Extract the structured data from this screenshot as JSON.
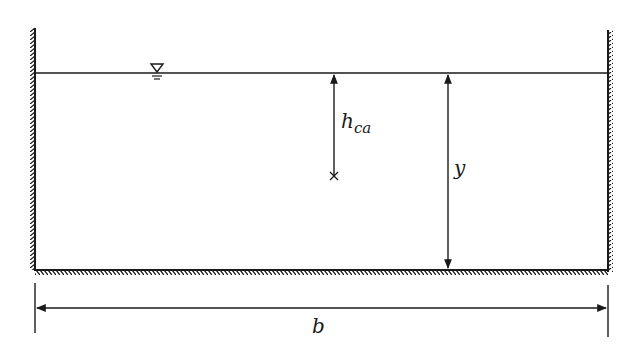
{
  "diagram": {
    "labels": {
      "depth_to_centroid": "h",
      "depth_to_centroid_sub": "ca",
      "flow_depth": "y",
      "channel_width": "b"
    },
    "symbols": {
      "water_surface": "water-surface-triangle-icon"
    },
    "colors": {
      "line": "#1a1a1a",
      "background": "#ffffff"
    },
    "geometry": {
      "left_wall_x": 35,
      "right_wall_x": 608,
      "water_surface_y": 73,
      "bed_y": 270,
      "hca_arrow_x": 334,
      "hca_end_y": 176,
      "y_arrow_x": 448,
      "b_dim_y": 308
    }
  }
}
